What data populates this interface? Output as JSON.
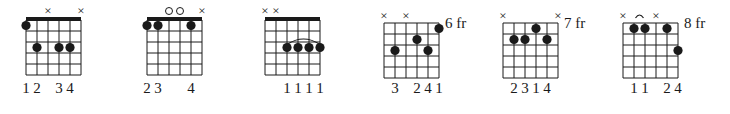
{
  "diagram": {
    "type": "guitar-chord-chart",
    "strings": 6,
    "frets_shown": 5,
    "colors": {
      "ink": "#1a1a1a",
      "background": "#ffffff"
    },
    "chords": [
      {
        "x": 26,
        "nut": true,
        "position_label": "",
        "markers": [
          "dot-nut",
          "",
          "x",
          "",
          "",
          "x"
        ],
        "dots": [
          {
            "string": 1,
            "fret": 1
          },
          {
            "string": 2,
            "fret": 3
          },
          {
            "string": 4,
            "fret": 3
          },
          {
            "string": 5,
            "fret": 3
          }
        ],
        "barre": null,
        "fingering": [
          "1",
          "2",
          "",
          "3",
          "4",
          ""
        ]
      },
      {
        "x": 147,
        "nut": true,
        "position_label": "",
        "markers": [
          "",
          "",
          "o",
          "o",
          "",
          "x"
        ],
        "dots": [
          {
            "string": 1,
            "fret": 1
          },
          {
            "string": 2,
            "fret": 1
          },
          {
            "string": 5,
            "fret": 1
          }
        ],
        "barre": null,
        "fingering": [
          "2",
          "3",
          "",
          "",
          "4",
          ""
        ]
      },
      {
        "x": 265,
        "nut": true,
        "position_label": "",
        "markers": [
          "x",
          "x",
          "",
          "",
          "",
          ""
        ],
        "dots": [
          {
            "string": 3,
            "fret": 3
          },
          {
            "string": 4,
            "fret": 3
          },
          {
            "string": 5,
            "fret": 3
          },
          {
            "string": 6,
            "fret": 3
          }
        ],
        "barre": {
          "from": 3,
          "to": 6,
          "fret": 3
        },
        "fingering": [
          "",
          "",
          "1",
          "1",
          "1",
          "1"
        ]
      },
      {
        "x": 384,
        "nut": false,
        "position_label": "6 fr",
        "markers": [
          "x",
          "",
          "x",
          "",
          "",
          ""
        ],
        "dots": [
          {
            "string": 6,
            "fret": 1
          },
          {
            "string": 4,
            "fret": 2
          },
          {
            "string": 2,
            "fret": 3
          },
          {
            "string": 5,
            "fret": 3
          }
        ],
        "barre": null,
        "fingering": [
          "",
          "3",
          "",
          "2",
          "4",
          "1"
        ]
      },
      {
        "x": 503,
        "nut": false,
        "position_label": "7 fr",
        "markers": [
          "x",
          "",
          "",
          "",
          "",
          "x"
        ],
        "dots": [
          {
            "string": 4,
            "fret": 1
          },
          {
            "string": 2,
            "fret": 2
          },
          {
            "string": 3,
            "fret": 2
          },
          {
            "string": 5,
            "fret": 2
          }
        ],
        "barre": null,
        "fingering": [
          "",
          "2",
          "3",
          "1",
          "4",
          ""
        ]
      },
      {
        "x": 623,
        "nut": false,
        "position_label": "8 fr",
        "markers": [
          "x",
          "",
          "",
          "x",
          "",
          ""
        ],
        "dots": [
          {
            "string": 2,
            "fret": 1
          },
          {
            "string": 3,
            "fret": 1
          },
          {
            "string": 5,
            "fret": 1
          },
          {
            "string": 6,
            "fret": 3
          }
        ],
        "barre": {
          "from": 2,
          "to": 3,
          "fret": 1,
          "style": "tie-above"
        },
        "fingering": [
          "",
          "1",
          "1",
          "",
          "2",
          "4"
        ]
      }
    ]
  }
}
